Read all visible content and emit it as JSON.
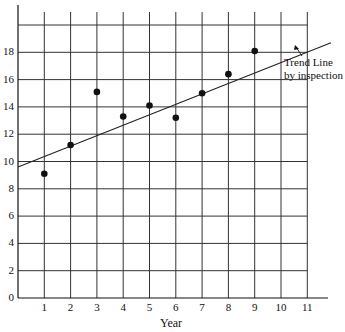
{
  "chart_data": {
    "type": "scatter",
    "title": "",
    "xlabel": "Year",
    "ylabel": "",
    "x": [
      1,
      2,
      3,
      4,
      5,
      6,
      7,
      8,
      9
    ],
    "values": [
      9.1,
      11.2,
      15.1,
      13.3,
      14.1,
      13.2,
      15.0,
      16.4,
      18.1
    ],
    "xlim": [
      0,
      11
    ],
    "ylim": [
      0,
      20
    ],
    "xticks": [
      "1",
      "2",
      "3",
      "4",
      "5",
      "6",
      "7",
      "8",
      "9",
      "10",
      "11"
    ],
    "yticks": [
      "0",
      "2",
      "4",
      "6",
      "8",
      "10",
      "12",
      "14",
      "16",
      "18"
    ],
    "grid": true,
    "trend_line": {
      "label_line1": "Trend Line",
      "label_line2": "by inspection",
      "start": {
        "x": 0,
        "y": 9.6
      },
      "end": {
        "x": 11.9,
        "y": 18.7
      }
    },
    "colors": {
      "line": "#222222",
      "point": "#111111",
      "grid": "#333333"
    }
  }
}
